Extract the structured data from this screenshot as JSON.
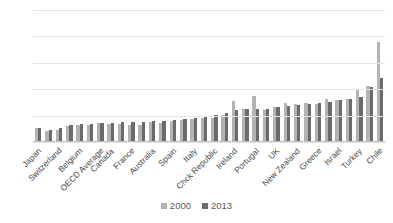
{
  "chart_data": {
    "type": "bar",
    "title": "",
    "subtitle": "",
    "xlabel": "",
    "ylabel": "",
    "ylim": [
      0,
      2.5
    ],
    "yticks": [
      0,
      0.5,
      1,
      1.5,
      2,
      2.5
    ],
    "ytick_labels": [
      "0",
      "0.5",
      "1",
      "1.5",
      "2",
      "2.5"
    ],
    "grid": true,
    "legend_position": "bottom",
    "categories": [
      "Japan",
      "",
      "Switzerland",
      "",
      "Belgium",
      "",
      "OECD Average",
      "Canada",
      "",
      "France",
      "",
      "Australia",
      "",
      "Spain",
      "",
      "Italy",
      "",
      "Chck Republic",
      "",
      "Ireland",
      "",
      "Portugal",
      "",
      "UK",
      "",
      "New Zealand",
      "",
      "Greece",
      "",
      "Israel",
      "",
      "Turkey",
      "",
      "Chile"
    ],
    "visible_tick_labels": [
      "Japan",
      "Switzerland",
      "Belgium",
      "OECD Average",
      "Canada",
      "France",
      "Australia",
      "Spain",
      "Italy",
      "Chck Republic",
      "Ireland",
      "Portugal",
      "UK",
      "New Zealand",
      "Greece",
      "Israel",
      "Turkey",
      "Chile"
    ],
    "series": [
      {
        "name": "2000",
        "color": "#b3b3b3",
        "values": [
          0.26,
          0.21,
          0.22,
          0.3,
          0.33,
          0.33,
          0.36,
          0.34,
          0.35,
          0.33,
          0.33,
          0.38,
          0.36,
          0.4,
          0.41,
          0.43,
          0.45,
          0.46,
          0.52,
          0.78,
          0.62,
          0.87,
          0.6,
          0.66,
          0.73,
          0.72,
          0.73,
          0.72,
          0.82,
          0.79,
          0.81,
          0.99,
          1.07,
          1.9
        ]
      },
      {
        "name": "2013",
        "color": "#6b6b6b",
        "values": [
          0.26,
          0.22,
          0.27,
          0.33,
          0.34,
          0.34,
          0.36,
          0.36,
          0.37,
          0.37,
          0.38,
          0.39,
          0.4,
          0.42,
          0.43,
          0.45,
          0.47,
          0.52,
          0.55,
          0.6,
          0.62,
          0.62,
          0.63,
          0.66,
          0.68,
          0.7,
          0.72,
          0.74,
          0.76,
          0.8,
          0.82,
          0.86,
          1.04,
          1.21
        ]
      }
    ],
    "legend": [
      "2000",
      "2013"
    ]
  }
}
